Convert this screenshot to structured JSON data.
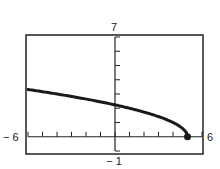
{
  "chart_data": {
    "type": "line",
    "title": "",
    "function": "y = sqrt(5 - x)",
    "xlabel": "",
    "ylabel": "",
    "xlim": [
      -6,
      6
    ],
    "ylim": [
      -1,
      7
    ],
    "xscale_ticks": 1,
    "yscale_ticks": 1,
    "window_labels": {
      "xmin": "− 6",
      "xmax": "6",
      "ymin": "− 1",
      "ymax": "7"
    },
    "grid": false,
    "series": [
      {
        "name": "curve",
        "x": [
          -6,
          -5,
          -4,
          -3,
          -2,
          -1,
          0,
          1,
          2,
          3,
          4,
          4.5,
          5
        ],
        "values": [
          3.317,
          3.162,
          3.0,
          2.828,
          2.646,
          2.449,
          2.236,
          2.0,
          1.732,
          1.414,
          1.0,
          0.707,
          0
        ]
      }
    ],
    "annotations": [
      {
        "type": "endpoint",
        "x": 5,
        "y": 0,
        "filled": true
      }
    ]
  }
}
